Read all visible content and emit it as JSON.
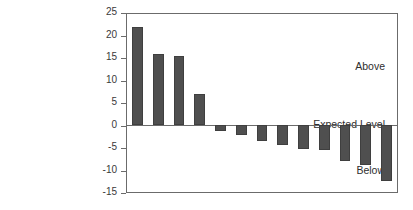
{
  "chart_data": {
    "type": "bar",
    "title": "",
    "subtitle": "",
    "xlabel": "",
    "ylabel": "",
    "ylim": [
      -15,
      25
    ],
    "ytick_step": 5,
    "yticks": [
      25,
      20,
      15,
      10,
      5,
      0,
      -5,
      -10,
      -15
    ],
    "ytick_labels": [
      "25",
      "20",
      "15",
      "10",
      "5",
      "0",
      "-5",
      "-10",
      "-15"
    ],
    "grid": false,
    "legend": false,
    "categories": [
      "1",
      "2",
      "3",
      "4",
      "5",
      "6",
      "7",
      "8",
      "9",
      "10",
      "11",
      "12",
      "13"
    ],
    "xtick_labels": [],
    "values": [
      22,
      16,
      15.5,
      7,
      -1.3,
      -2.3,
      -3.6,
      -4.4,
      -5.3,
      -5.5,
      -8,
      -9,
      -12.5
    ],
    "annotations": [
      {
        "text": "Above",
        "value": 12.5
      },
      {
        "text": "Expected Level",
        "value": 0
      },
      {
        "text": "Below",
        "value": -10
      }
    ],
    "bar_color": "#4f4f4f",
    "bar_edge_color": "#3f3f3f",
    "axis_color": "#6b6b6b",
    "background_color": "#ffffff"
  },
  "axis": {
    "tick_labels": [
      "25",
      "20",
      "15",
      "10",
      "5",
      "0",
      "-5",
      "-10",
      "-15"
    ]
  },
  "side_labels": {
    "above": "Above",
    "expected": "Expected Level",
    "below": "Below"
  }
}
